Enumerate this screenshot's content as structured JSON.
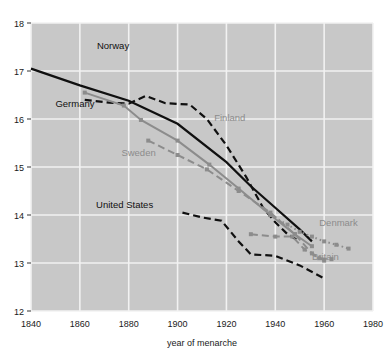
{
  "figure": {
    "background": "#ffffff",
    "plot_background": "#c8c8c8",
    "grid_color": "#f2f2f2",
    "dark_series_color": "#101010",
    "light_series_color": "#8c8c8c",
    "tick_text_color": "#1a1a1a"
  },
  "chart_data": {
    "type": "line",
    "title": "",
    "subtitle": "",
    "xlabel": "year of menarche",
    "ylabel": "",
    "xlim": [
      1840,
      1980
    ],
    "ylim": [
      12,
      18
    ],
    "xticks": [
      1840,
      1860,
      1880,
      1900,
      1920,
      1940,
      1960,
      1980
    ],
    "xticklabels": [
      "1840",
      "1860",
      "1880",
      "1900",
      "1920",
      "1940",
      "1960",
      "1980"
    ],
    "yticks": [
      12,
      13,
      14,
      15,
      16,
      17,
      18
    ],
    "yticklabels": [
      "12",
      "13",
      "14",
      "15",
      "16",
      "17",
      "18"
    ],
    "grid": true,
    "legend": "inline-annotations",
    "series": [
      {
        "name": "Norway",
        "color": "#101010",
        "style": "solid",
        "width": 2.2,
        "markers": false,
        "label_x": 1867,
        "label_y": 17.45,
        "label_anchor": "start",
        "points": [
          [
            1840,
            17.05
          ],
          [
            1860,
            16.7
          ],
          [
            1880,
            16.38
          ],
          [
            1900,
            15.9
          ],
          [
            1920,
            15.1
          ],
          [
            1930,
            14.6
          ],
          [
            1940,
            14.15
          ],
          [
            1950,
            13.7
          ],
          [
            1955,
            13.45
          ]
        ]
      },
      {
        "name": "Germany",
        "color": "#101010",
        "style": "dashed",
        "width": 2.2,
        "markers": false,
        "label_x": 1850,
        "label_y": 16.25,
        "label_anchor": "start",
        "points": [
          [
            1862,
            16.4
          ],
          [
            1872,
            16.34
          ],
          [
            1880,
            16.32
          ],
          [
            1887,
            16.48
          ],
          [
            1895,
            16.33
          ],
          [
            1905,
            16.3
          ],
          [
            1912,
            16.0
          ],
          [
            1920,
            15.45
          ],
          [
            1928,
            14.8
          ],
          [
            1935,
            14.15
          ],
          [
            1940,
            13.85
          ],
          [
            1945,
            13.6
          ],
          [
            1950,
            13.45
          ]
        ]
      },
      {
        "name": "Finland",
        "color": "#8c8c8c",
        "style": "solid",
        "width": 2.0,
        "markers": true,
        "label_x": 1915,
        "label_y": 15.95,
        "label_anchor": "start",
        "points": [
          [
            1862,
            16.55
          ],
          [
            1878,
            16.28
          ],
          [
            1885,
            15.98
          ],
          [
            1900,
            15.55
          ],
          [
            1913,
            15.05
          ],
          [
            1925,
            14.55
          ],
          [
            1938,
            14.0
          ],
          [
            1948,
            13.6
          ],
          [
            1955,
            13.35
          ]
        ]
      },
      {
        "name": "Sweden",
        "color": "#8c8c8c",
        "style": "dashed",
        "width": 2.0,
        "markers": true,
        "label_x": 1877,
        "label_y": 15.22,
        "label_anchor": "start",
        "points": [
          [
            1888,
            15.55
          ],
          [
            1900,
            15.25
          ],
          [
            1912,
            14.95
          ],
          [
            1925,
            14.5
          ],
          [
            1938,
            14.05
          ],
          [
            1948,
            13.6
          ],
          [
            1955,
            13.2
          ],
          [
            1960,
            13.05
          ]
        ]
      },
      {
        "name": "United States",
        "color": "#101010",
        "style": "dashed",
        "width": 2.2,
        "markers": false,
        "label_x": 1890,
        "label_y": 14.15,
        "label_anchor": "end",
        "points": [
          [
            1902,
            14.05
          ],
          [
            1910,
            13.95
          ],
          [
            1918,
            13.88
          ],
          [
            1925,
            13.45
          ],
          [
            1930,
            13.18
          ],
          [
            1940,
            13.15
          ],
          [
            1950,
            12.95
          ],
          [
            1960,
            12.68
          ]
        ]
      },
      {
        "name": "Denmark",
        "color": "#8c8c8c",
        "style": "dotted",
        "width": 2.0,
        "markers": true,
        "label_x": 1958,
        "label_y": 13.78,
        "label_anchor": "start",
        "points": [
          [
            1938,
            14.0
          ],
          [
            1945,
            13.8
          ],
          [
            1950,
            13.65
          ],
          [
            1955,
            13.55
          ],
          [
            1960,
            13.45
          ],
          [
            1965,
            13.38
          ],
          [
            1970,
            13.3
          ]
        ]
      },
      {
        "name": "Britain",
        "color": "#8c8c8c",
        "style": "dashed",
        "width": 2.0,
        "markers": true,
        "label_x": 1955,
        "label_y": 13.07,
        "label_anchor": "start",
        "points": [
          [
            1930,
            13.6
          ],
          [
            1940,
            13.55
          ],
          [
            1947,
            13.55
          ],
          [
            1952,
            13.28
          ],
          [
            1958,
            13.1
          ],
          [
            1963,
            13.08
          ]
        ]
      }
    ]
  }
}
